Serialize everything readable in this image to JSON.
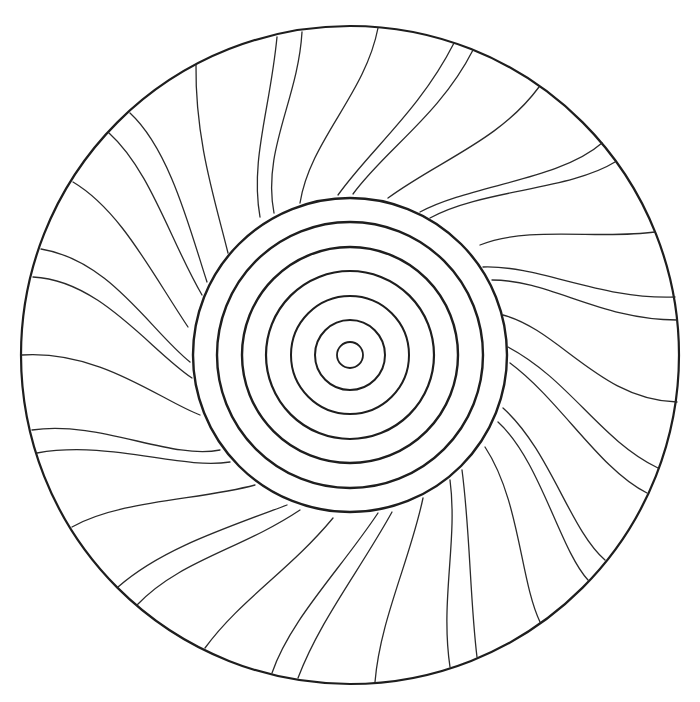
{
  "artwork": {
    "title": "Mandala coloring page",
    "background": "#ffffff",
    "stroke_color": "#1e1e1e",
    "center": [
      350,
      355
    ],
    "outer_circle": {
      "r": 329,
      "stroke_width": 2.2
    },
    "concentric_rings": [
      {
        "r": 157,
        "stroke_width": 2.4
      },
      {
        "r": 133,
        "stroke_width": 2.4
      },
      {
        "r": 108,
        "stroke_width": 2.4
      },
      {
        "r": 84,
        "stroke_width": 2.2
      },
      {
        "r": 59,
        "stroke_width": 2.0
      },
      {
        "r": 35,
        "stroke_width": 2.0
      },
      {
        "r": 13,
        "stroke_width": 1.8
      }
    ],
    "swirl_lines": [
      {
        "d": "M 260 217 C 250 160, 270 110, 277 37"
      },
      {
        "d": "M 274 213 C 262 150, 298 100, 302 32"
      },
      {
        "d": "M 228 253 C 215 200, 195 140, 196 65"
      },
      {
        "d": "M 300 203 C 310 140, 365 95, 378 28"
      },
      {
        "d": "M 338 195 C 370 150, 420 110, 454 43"
      },
      {
        "d": "M 353 194 C 385 150, 440 115, 473 50"
      },
      {
        "d": "M 388 198 C 440 160, 500 140, 539 87"
      },
      {
        "d": "M 420 212 C 470 185, 560 180, 602 143"
      },
      {
        "d": "M 430 218 C 480 190, 570 190, 615 162"
      },
      {
        "d": "M 480 245 C 530 225, 600 240, 655 232"
      },
      {
        "d": "M 483 267 C 540 265, 600 300, 675 297"
      },
      {
        "d": "M 492 280 C 550 280, 600 320, 677 320"
      },
      {
        "d": "M 503 315 C 560 330, 600 400, 677 402"
      },
      {
        "d": "M 508 347 C 570 380, 600 440, 658 468"
      },
      {
        "d": "M 510 363 C 560 400, 600 470, 647 493"
      },
      {
        "d": "M 503 408 C 550 450, 570 530, 605 560"
      },
      {
        "d": "M 498 422 C 540 460, 560 550, 588 580"
      },
      {
        "d": "M 485 447 C 520 500, 520 580, 540 622"
      },
      {
        "d": "M 462 470 C 470 530, 470 600, 477 657"
      },
      {
        "d": "M 450 480 C 458 540, 440 600, 450 667"
      },
      {
        "d": "M 423 498 C 410 560, 380 620, 375 682"
      },
      {
        "d": "M 392 512 C 360 570, 320 620, 298 678"
      },
      {
        "d": "M 378 513 C 340 570, 290 620, 272 673"
      },
      {
        "d": "M 333 518 C 290 570, 240 600, 205 648"
      },
      {
        "d": "M 300 510 C 240 550, 180 560, 137 605"
      },
      {
        "d": "M 287 505 C 220 530, 160 550, 118 587"
      },
      {
        "d": "M 255 485 C 200 500, 120 500, 72 527"
      },
      {
        "d": "M 230 462 C 180 470, 110 440, 37 453"
      },
      {
        "d": "M 220 450 C 170 460, 100 420, 32 430"
      },
      {
        "d": "M 200 415 C 160 400, 100 350, 22 355"
      },
      {
        "d": "M 192 378 C 150 350, 100 280, 33 277"
      },
      {
        "d": "M 190 362 C 150 330, 110 260, 41 249"
      },
      {
        "d": "M 188 327 C 150 270, 120 210, 73 182"
      },
      {
        "d": "M 202 295 C 170 240, 150 170, 109 133"
      },
      {
        "d": "M 207 282 C 190 230, 170 150, 130 113"
      }
    ]
  }
}
